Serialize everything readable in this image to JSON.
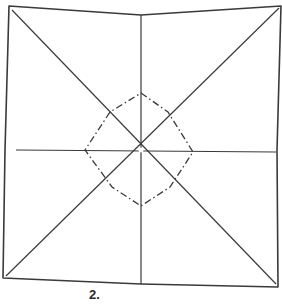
{
  "diagram": {
    "type": "origami-fold-diagram",
    "step_label": "2.",
    "colors": {
      "line": "#3a3a3a",
      "background": "#ffffff"
    },
    "outer_paper": {
      "points": [
        [
          9,
          6
        ],
        [
          141,
          15
        ],
        [
          281,
          6
        ],
        [
          277,
          150
        ],
        [
          278,
          287
        ],
        [
          141,
          284
        ],
        [
          3,
          278
        ],
        [
          5,
          150
        ]
      ]
    },
    "valley_folds": [
      {
        "name": "diagonal-tl-br",
        "from": [
          12,
          10
        ],
        "to": [
          276,
          284
        ]
      },
      {
        "name": "diagonal-tr-bl",
        "from": [
          279,
          8
        ],
        "to": [
          6,
          276
        ]
      },
      {
        "name": "vertical-midline",
        "from": [
          141,
          15
        ],
        "to": [
          141,
          284
        ]
      },
      {
        "name": "horizontal-midline",
        "from": [
          16,
          150
        ],
        "to": [
          276,
          152
        ]
      }
    ],
    "mountain_fold_diamond": {
      "points": [
        [
          141,
          93
        ],
        [
          168,
          112
        ],
        [
          193,
          152
        ],
        [
          170,
          187
        ],
        [
          141,
          206
        ],
        [
          112,
          187
        ],
        [
          85,
          150
        ],
        [
          110,
          112
        ]
      ]
    },
    "center": [
      141,
      150
    ]
  }
}
